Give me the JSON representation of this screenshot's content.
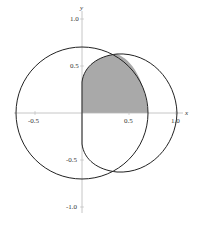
{
  "diagram": {
    "type": "polar-region-plot",
    "axes": {
      "x_label": "x",
      "y_label": "y",
      "x_ticks": [
        "-0.5",
        "0.5",
        "1.0"
      ],
      "y_ticks": [
        "1.0",
        "0.5",
        "-0.5",
        "-1.0"
      ]
    },
    "curves": [
      {
        "name": "circle",
        "center": [
          0,
          0
        ],
        "radius": 0.7
      },
      {
        "name": "loop-curve",
        "x_range": [
          0,
          1.0
        ],
        "y_max": 0.62
      }
    ],
    "shaded_region": {
      "quadrant": "first",
      "color": "#a9a9a9",
      "description": "intersection of circle and loop curve"
    },
    "colors": {
      "stroke": "#222222",
      "axis": "#b8b8b8",
      "fill": "#a9a9a9"
    }
  }
}
